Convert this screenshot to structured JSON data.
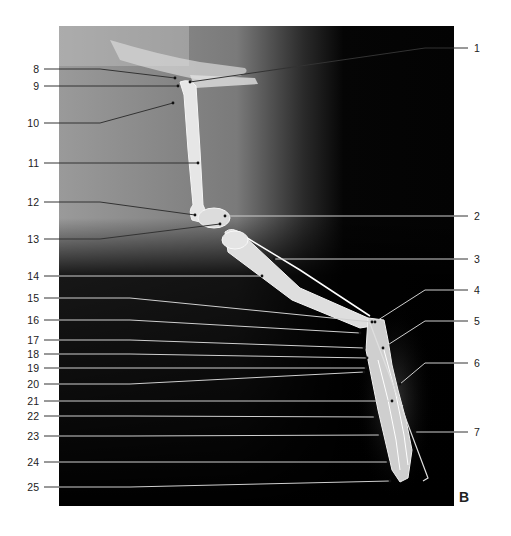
{
  "figure": {
    "panel_letter": "B",
    "image_region": {
      "x": 59,
      "y": 26,
      "w": 395,
      "h": 480
    },
    "colors": {
      "leader_line": "#cfcfcf",
      "leader_line_dark": "#333333",
      "label_text": "#222222",
      "bone": "#e8e8e8",
      "background_dark": "#050505"
    }
  },
  "labels": {
    "left": [
      {
        "num": "8",
        "y": 69,
        "tx": 175,
        "ty": 78
      },
      {
        "num": "9",
        "y": 86,
        "tx": 178,
        "ty": 86
      },
      {
        "num": "10",
        "y": 123,
        "tx": 173,
        "ty": 103
      },
      {
        "num": "11",
        "y": 163,
        "tx": 198,
        "ty": 163
      },
      {
        "num": "12",
        "y": 202,
        "tx": 195,
        "ty": 215
      },
      {
        "num": "13",
        "y": 239,
        "tx": 220,
        "ty": 224
      },
      {
        "num": "14",
        "y": 276,
        "tx": 262,
        "ty": 276
      },
      {
        "num": "15",
        "y": 298,
        "tx": 372,
        "ty": 322
      },
      {
        "num": "16",
        "y": 320,
        "tx": 360,
        "ty": 333
      },
      {
        "num": "17",
        "y": 340,
        "tx": 364,
        "ty": 348
      },
      {
        "num": "18",
        "y": 354,
        "tx": 367,
        "ty": 358
      },
      {
        "num": "19",
        "y": 368,
        "tx": 366,
        "ty": 368
      },
      {
        "num": "20",
        "y": 384,
        "tx": 364,
        "ty": 372
      },
      {
        "num": "21",
        "y": 401,
        "tx": 392,
        "ty": 401
      },
      {
        "num": "22",
        "y": 416,
        "tx": 375,
        "ty": 417
      },
      {
        "num": "23",
        "y": 436,
        "tx": 380,
        "ty": 435
      },
      {
        "num": "24",
        "y": 462,
        "tx": 388,
        "ty": 462
      },
      {
        "num": "25",
        "y": 487,
        "tx": 390,
        "ty": 481
      }
    ],
    "right": [
      {
        "num": "1",
        "y": 48,
        "tx": 190,
        "ty": 82
      },
      {
        "num": "2",
        "y": 216,
        "tx": 225,
        "ty": 216
      },
      {
        "num": "3",
        "y": 259,
        "tx": 274,
        "ty": 259
      },
      {
        "num": "4",
        "y": 290,
        "tx": 375,
        "ty": 322
      },
      {
        "num": "5",
        "y": 321,
        "tx": 383,
        "ty": 348
      },
      {
        "num": "6",
        "y": 363,
        "tx": 400,
        "ty": 384
      },
      {
        "num": "7",
        "y": 432,
        "tx": 415,
        "ty": 432
      }
    ]
  }
}
